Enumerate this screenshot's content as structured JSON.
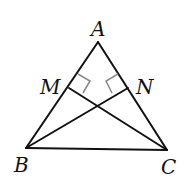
{
  "diagram": {
    "type": "geometry-triangle",
    "points": {
      "A": {
        "label": "A",
        "x": 98,
        "y": 42
      },
      "B": {
        "label": "B",
        "x": 26,
        "y": 148
      },
      "C": {
        "label": "C",
        "x": 167,
        "y": 150
      },
      "M": {
        "label": "M",
        "x": 69,
        "y": 88
      },
      "N": {
        "label": "N",
        "x": 128,
        "y": 88
      }
    },
    "segments": [
      "AB",
      "AC",
      "BC",
      "BN",
      "CM"
    ],
    "right_angles": [
      "CM ⊥ AB at M",
      "BN ⊥ AC at N"
    ],
    "colors": {
      "line": "#111111",
      "mark": "#888888"
    }
  }
}
